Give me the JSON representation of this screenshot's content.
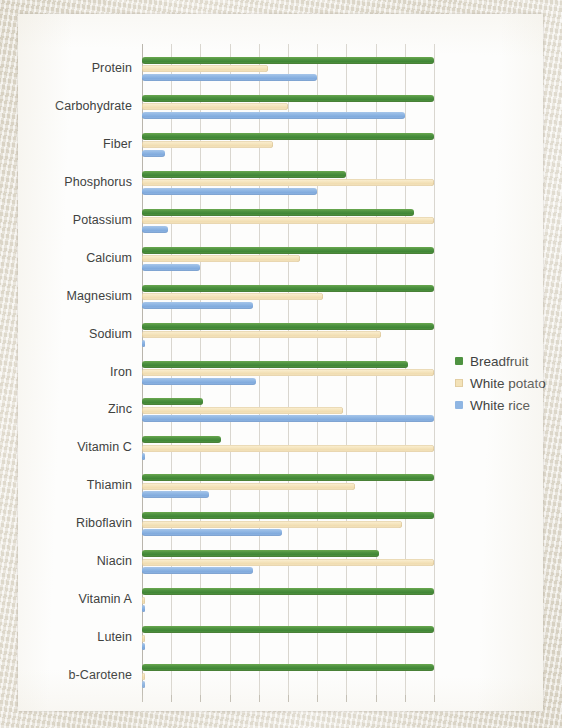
{
  "legend": {
    "position": "right",
    "items": [
      {
        "label": "Breadfruit",
        "color": "#4e9240"
      },
      {
        "label": "White potato",
        "color": "#f3e2b8"
      },
      {
        "label": "White rice",
        "color": "#8fb6e3"
      }
    ]
  },
  "chart_data": {
    "type": "bar",
    "orientation": "horizontal",
    "title": "",
    "subtitle": "",
    "xlabel": "",
    "ylabel": "",
    "grid": true,
    "xlim": [
      0,
      100
    ],
    "xtick_labels": [],
    "gridline_count": 10,
    "categories": [
      "Protein",
      "Carbohydrate",
      "Fiber",
      "Phosphorus",
      "Potassium",
      "Calcium",
      "Magnesium",
      "Sodium",
      "Iron",
      "Zinc",
      "Vitamin C",
      "Thiamin",
      "Riboflavin",
      "Niacin",
      "Vitamin A",
      "Lutein",
      "b-Carotene"
    ],
    "series": [
      {
        "name": "Breadfruit",
        "color": "#4e9240",
        "values": [
          100,
          100,
          100,
          70,
          93,
          100,
          100,
          100,
          91,
          21,
          27,
          100,
          100,
          81,
          100,
          100,
          100
        ]
      },
      {
        "name": "White potato",
        "color": "#f3e2b8",
        "values": [
          43,
          50,
          45,
          100,
          100,
          54,
          62,
          82,
          100,
          69,
          100,
          73,
          89,
          100,
          1,
          1,
          1
        ]
      },
      {
        "name": "White rice",
        "color": "#8fb6e3",
        "values": [
          60,
          90,
          8,
          60,
          9,
          20,
          38,
          1,
          39,
          100,
          1,
          23,
          48,
          38,
          1,
          1,
          1
        ]
      }
    ]
  }
}
